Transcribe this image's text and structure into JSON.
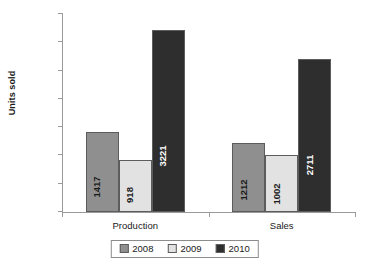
{
  "chart_data": {
    "type": "bar",
    "title": "",
    "subtitle": "",
    "xlabel": "",
    "ylabel": "Units sold",
    "categories": [
      "Production",
      "Sales"
    ],
    "series": [
      {
        "name": "2008",
        "values": [
          1417,
          1212
        ],
        "color": "#8f8f8f"
      },
      {
        "name": "2009",
        "values": [
          918,
          1002
        ],
        "color": "#e2e2e2"
      },
      {
        "name": "2010",
        "values": [
          3221,
          2711
        ],
        "color": "#2e2e2e"
      }
    ],
    "ylim": [
      0,
      3500
    ],
    "yticks": [
      0,
      500,
      1000,
      1500,
      2000,
      2500,
      3000,
      3500
    ],
    "ytick_labels": [
      "0",
      "500",
      "1000",
      "1500",
      "2000",
      "2500",
      "3000",
      "3500"
    ],
    "grid": false,
    "legend_position": "bottom",
    "data_labels_shown": true,
    "data_label_rotation": 90,
    "axis_color": "#9a9a9a",
    "bar_border_color": "#5c5c5c",
    "background": "#ffffff"
  },
  "axis": {
    "y_label": "Units sold"
  },
  "legend": {
    "entries": [
      {
        "label": "2008",
        "color": "#8f8f8f"
      },
      {
        "label": "2009",
        "color": "#e2e2e2"
      },
      {
        "label": "2010",
        "color": "#2e2e2e"
      }
    ]
  }
}
